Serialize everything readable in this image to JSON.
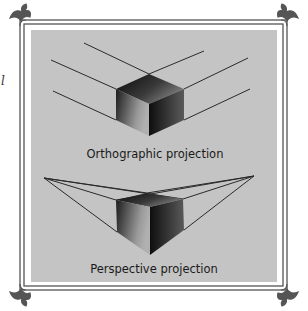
{
  "figure": {
    "labels": {
      "orthographic": "Orthographic projection",
      "perspective": "Perspective projection"
    },
    "side_fragment": "l",
    "colors": {
      "panel": "#c4c4c4",
      "frame": "#555555",
      "line": "#2a2a2a",
      "cube_dark": "#111111",
      "cube_light": "#8a8a8a",
      "background": "#ffffff"
    },
    "ornaments": [
      "top-left-flourish",
      "top-right-flourish",
      "bottom-left-flourish",
      "bottom-right-flourish"
    ]
  }
}
